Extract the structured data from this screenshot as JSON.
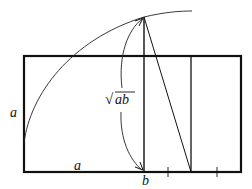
{
  "diagram": {
    "labels": {
      "left_side": "a",
      "bottom_segment": "a",
      "bottom_point": "b",
      "mean": "ab",
      "mean_radical": "√"
    },
    "colors": {
      "stroke": "#111111",
      "background": "#ffffff"
    }
  }
}
